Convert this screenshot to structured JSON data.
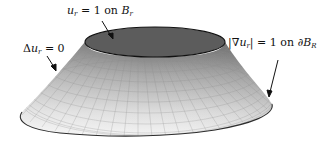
{
  "figure": {
    "colors": {
      "top_disk": "#5c5c5c",
      "top_outline": "#111111",
      "surface_dark": "#7a7a7a",
      "surface_light": "#f2f2f2",
      "grid": "#9a9a9a",
      "bottom_outline": "#333333",
      "arrow": "#111111"
    }
  },
  "labels": {
    "top": {
      "var": "u",
      "var_sub": "r",
      "rest": " = 1 on ",
      "set": "B",
      "set_sub": "r"
    },
    "left": {
      "op": "Δ",
      "var": "u",
      "var_sub": "r",
      "rest": " = 0"
    },
    "right": {
      "open": "|∇",
      "var": "u",
      "var_sub": "r",
      "close": "| = 1 on ∂",
      "set": "B",
      "set_sub": "R"
    }
  }
}
